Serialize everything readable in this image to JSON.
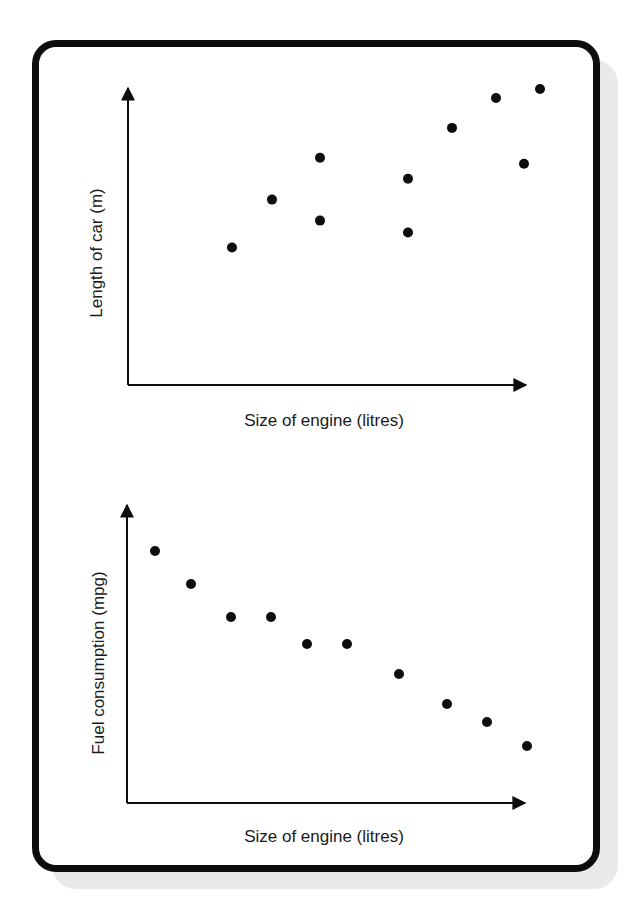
{
  "chart_data": [
    {
      "type": "scatter",
      "title": "",
      "xlabel": "Size of engine (litres)",
      "ylabel": "Length of car (m)",
      "xlim": [
        0,
        10
      ],
      "ylim": [
        0,
        10
      ],
      "grid": false,
      "ticks": false,
      "legend": null,
      "points": [
        {
          "x": 2.6,
          "y": 4.6
        },
        {
          "x": 3.6,
          "y": 6.2
        },
        {
          "x": 4.8,
          "y": 7.6
        },
        {
          "x": 4.8,
          "y": 5.5
        },
        {
          "x": 7.0,
          "y": 6.9
        },
        {
          "x": 7.0,
          "y": 5.1
        },
        {
          "x": 8.1,
          "y": 8.6
        },
        {
          "x": 9.2,
          "y": 9.6
        },
        {
          "x": 10.3,
          "y": 9.9
        },
        {
          "x": 9.9,
          "y": 7.4
        }
      ],
      "trend": "positive correlation"
    },
    {
      "type": "scatter",
      "title": "",
      "xlabel": "Size of engine (litres)",
      "ylabel": "Fuel consumption (mpg)",
      "xlim": [
        0,
        10
      ],
      "ylim": [
        0,
        10
      ],
      "grid": false,
      "ticks": false,
      "legend": null,
      "points": [
        {
          "x": 0.7,
          "y": 8.4
        },
        {
          "x": 1.6,
          "y": 7.3
        },
        {
          "x": 2.6,
          "y": 6.2
        },
        {
          "x": 3.6,
          "y": 6.2
        },
        {
          "x": 4.5,
          "y": 5.3
        },
        {
          "x": 5.5,
          "y": 5.3
        },
        {
          "x": 6.8,
          "y": 4.3
        },
        {
          "x": 8.0,
          "y": 3.3
        },
        {
          "x": 9.0,
          "y": 2.7
        },
        {
          "x": 10.0,
          "y": 1.9
        }
      ],
      "trend": "negative correlation"
    }
  ],
  "colors": {
    "ink": "#0d0d0d",
    "shadow": "#e9e9e9",
    "background": "#ffffff"
  }
}
